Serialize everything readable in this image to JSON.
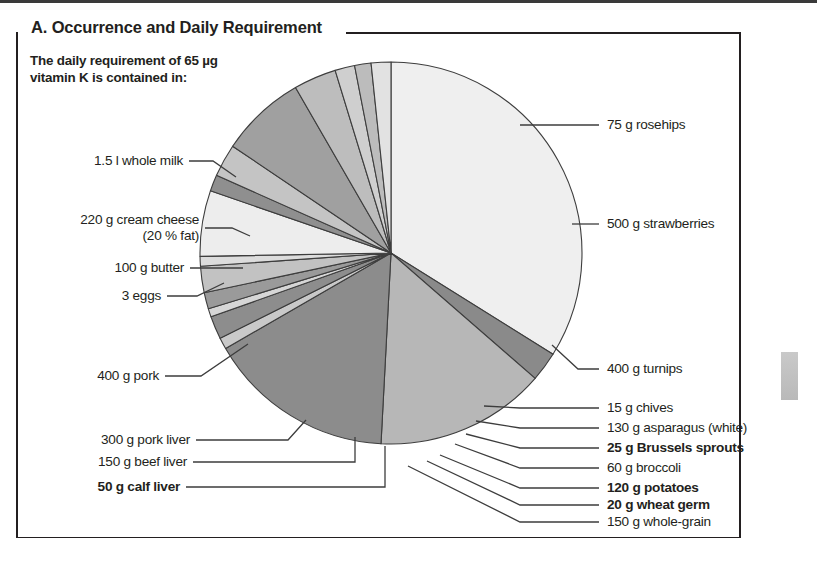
{
  "panel": {
    "title": "A. Occurrence and Daily Requirement",
    "intro_line1": "The daily requirement of 65 µg",
    "intro_line2": "vitamin K is contained in:"
  },
  "chart_data": {
    "type": "pie",
    "title": "A. Occurrence and Daily Requirement",
    "subtitle": "The daily requirement of 65 µg vitamin K is contained in:",
    "units": "degrees of a 360° pie (relative portion size needed to supply 65 µg vitamin K)",
    "legend": "none (direct leader-line labels)",
    "grid": false,
    "categories": [
      "1.5 l whole milk",
      "75 g rosehips",
      "500 g strawberries",
      "400 g turnips",
      "15 g chives",
      "130 g asparagus (white)",
      "25 g Brussels sprouts",
      "60 g broccoli",
      "120 g potatoes",
      "20 g wheat germ",
      "150 g whole-grain",
      "50 g calf liver",
      "150 g beef liver",
      "300 g pork liver",
      "400 g pork",
      "3 eggs",
      "100 g butter",
      "220 g cream cheese (20 % fat)"
    ],
    "values": [
      122,
      9,
      52,
      57,
      3.5,
      7,
      2.5,
      5,
      8,
      3,
      20,
      5,
      10,
      26,
      13,
      6,
      5,
      6
    ],
    "slices": [
      {
        "label": "1.5 l whole milk",
        "value": 122,
        "shade": "#efefef",
        "bold": false
      },
      {
        "label": "75 g rosehips",
        "value": 9,
        "shade": "#8a8a8a",
        "bold": false
      },
      {
        "label": "500 g strawberries",
        "value": 52,
        "shade": "#b7b7b7",
        "bold": false
      },
      {
        "label": "400 g turnips",
        "value": 57,
        "shade": "#8c8c8c",
        "bold": false
      },
      {
        "label": "15 g chives",
        "value": 3.5,
        "shade": "#c9c9c9",
        "bold": false
      },
      {
        "label": "130 g asparagus (white)",
        "value": 7,
        "shade": "#8d8d8d",
        "bold": false
      },
      {
        "label": "25 g Brussels sprouts",
        "value": 2.5,
        "shade": "#d6d6d6",
        "bold": true
      },
      {
        "label": "60 g broccoli",
        "value": 5,
        "shade": "#9a9a9a",
        "bold": false
      },
      {
        "label": "120 g potatoes",
        "value": 8,
        "shade": "#c2c2c2",
        "bold": true
      },
      {
        "label": "20 g wheat germ",
        "value": 3,
        "shade": "#dcdcdc",
        "bold": true
      },
      {
        "label": "150 g whole-grain",
        "value": 20,
        "shade": "#ededed",
        "bold": false
      },
      {
        "label": "50 g calf liver",
        "value": 5,
        "shade": "#8f8f8f",
        "bold": true
      },
      {
        "label": "150 g beef liver",
        "value": 10,
        "shade": "#c4c4c4",
        "bold": false
      },
      {
        "label": "300 g pork liver",
        "value": 26,
        "shade": "#a0a0a0",
        "bold": false
      },
      {
        "label": "400 g pork",
        "value": 13,
        "shade": "#bdbdbd",
        "bold": false
      },
      {
        "label": "3 eggs",
        "value": 6,
        "shade": "#cfcfcf",
        "bold": false
      },
      {
        "label": "100 g butter",
        "value": 5,
        "shade": "#bcbcbc",
        "bold": false
      },
      {
        "label": "220 g cream cheese (20 % fat)",
        "value": 6,
        "shade": "#e2e2e2",
        "bold": false
      }
    ],
    "geometry": {
      "cx": 391,
      "cy": 253,
      "r": 191,
      "start_angle_deg": -90
    }
  },
  "labels": {
    "rosehips": "75 g rosehips",
    "strawberries": "500 g strawberries",
    "turnips": "400 g turnips",
    "chives": "15 g chives",
    "asparagus": "130 g asparagus (white)",
    "brussels": "25 g Brussels sprouts",
    "broccoli": "60 g broccoli",
    "potatoes": "120 g potatoes",
    "wheat_germ": "20 g wheat germ",
    "whole_grain": "150 g whole-grain",
    "whole_milk": "1.5 l whole milk",
    "cream_cheese_l1": "220 g cream cheese",
    "cream_cheese_l2": "(20 % fat)",
    "butter": "100 g butter",
    "eggs": "3 eggs",
    "pork": "400 g pork",
    "pork_liver": "300 g pork liver",
    "beef_liver": "150 g beef liver",
    "calf_liver": "50 g calf liver"
  },
  "colors": {
    "ink": "#231f20",
    "stroke": "#3d3d3d",
    "page_background": "#ffffff"
  }
}
